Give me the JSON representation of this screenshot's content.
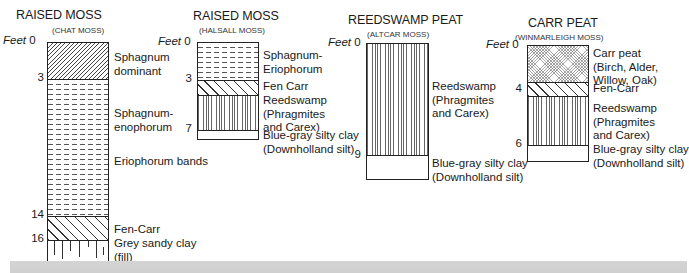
{
  "diagram": {
    "depth_unit_label": "Feet",
    "columns": [
      {
        "title": "RAISED MOSS",
        "subtitle": "(CHAT MOSS)",
        "ticks": [
          "0",
          "3",
          "14",
          "16"
        ],
        "layers": [
          {
            "name": "Sphagnum dominant",
            "label_lines": [
              "Sphagnum",
              "dominant"
            ],
            "pattern": "fine-diagonal",
            "from_ft": 0,
            "to_ft": 3
          },
          {
            "name": "Sphagnum-enophorum",
            "label_lines": [
              "Sphagnum-",
              "enophorum"
            ],
            "pattern": "dashes",
            "from_ft": 3,
            "to_ft": 14
          },
          {
            "name": "Eriophorum bands",
            "label_lines": [
              "Eriophorum bands"
            ],
            "pattern": "dashes",
            "from_ft": 3,
            "to_ft": 14
          },
          {
            "name": "Fen-Carr",
            "label_lines": [
              "Fen-Carr"
            ],
            "pattern": "coarse-diagonal",
            "from_ft": 14,
            "to_ft": 16
          },
          {
            "name": "Grey sandy clay (fill)",
            "label_lines": [
              "Grey sandy clay",
              "(fill)"
            ],
            "pattern": "vertical-ticks",
            "from_ft": 16,
            "to_ft": null
          }
        ]
      },
      {
        "title": "RAISED MOSS",
        "subtitle": "(HALSALL MOSS)",
        "ticks": [
          "0",
          "3",
          "7"
        ],
        "layers": [
          {
            "name": "Sphagnum-Eriophorum",
            "label_lines": [
              "Sphagnum-",
              "Eriophorum"
            ],
            "pattern": "dashes",
            "from_ft": 0,
            "to_ft": 3
          },
          {
            "name": "Fen Carr",
            "label_lines": [
              "Fen Carr"
            ],
            "pattern": "coarse-diagonal",
            "from_ft": 3,
            "to_ft": null
          },
          {
            "name": "Reedswamp (Phragmites and Carex)",
            "label_lines": [
              "Reedswamp",
              "(Phragmites",
              "and Carex)"
            ],
            "pattern": "vertical-lines",
            "from_ft": null,
            "to_ft": 7
          },
          {
            "name": "Blue-gray silty clay (Downholland silt)",
            "label_lines": [
              "Blue-gray silty clay",
              "(Downholland silt)"
            ],
            "pattern": "blank",
            "from_ft": 7,
            "to_ft": null
          }
        ]
      },
      {
        "title": "REEDSWAMP PEAT",
        "subtitle": "(ALTCAR MOSS)",
        "ticks": [
          "0",
          "9"
        ],
        "layers": [
          {
            "name": "Reedswamp (Phragmites and Carex)",
            "label_lines": [
              "Reedswamp",
              "(Phragmites",
              "and Carex)"
            ],
            "pattern": "vertical-lines",
            "from_ft": 0,
            "to_ft": 9
          },
          {
            "name": "Blue-gray silty clay (Downholland silt)",
            "label_lines": [
              "Blue-gray silty clay",
              "(Downholland silt)"
            ],
            "pattern": "blank",
            "from_ft": 9,
            "to_ft": null
          }
        ]
      },
      {
        "title": "CARR PEAT",
        "subtitle": "(WINMARLEIGH MOSS)",
        "ticks": [
          "0",
          "4",
          "6"
        ],
        "layers": [
          {
            "name": "Carr peat (Birch, Alder, Willow, Oak)",
            "label_lines": [
              "Carr peat",
              "(Birch, Alder,",
              "Willow, Oak)"
            ],
            "pattern": "crosshatch",
            "from_ft": 0,
            "to_ft": 4
          },
          {
            "name": "Fen-Carr",
            "label_lines": [
              "Fen-Carr"
            ],
            "pattern": "coarse-diagonal",
            "from_ft": 4,
            "to_ft": null
          },
          {
            "name": "Reedswamp (Phragmites and Carex)",
            "label_lines": [
              "Reedswamp",
              "(Phragmites",
              "and Carex)"
            ],
            "pattern": "vertical-lines",
            "from_ft": null,
            "to_ft": 6
          },
          {
            "name": "Blue-gray silty clay (Downholland silt)",
            "label_lines": [
              "Blue-gray silty clay",
              "(Downholland silt)"
            ],
            "pattern": "blank",
            "from_ft": 6,
            "to_ft": null
          }
        ]
      }
    ]
  }
}
